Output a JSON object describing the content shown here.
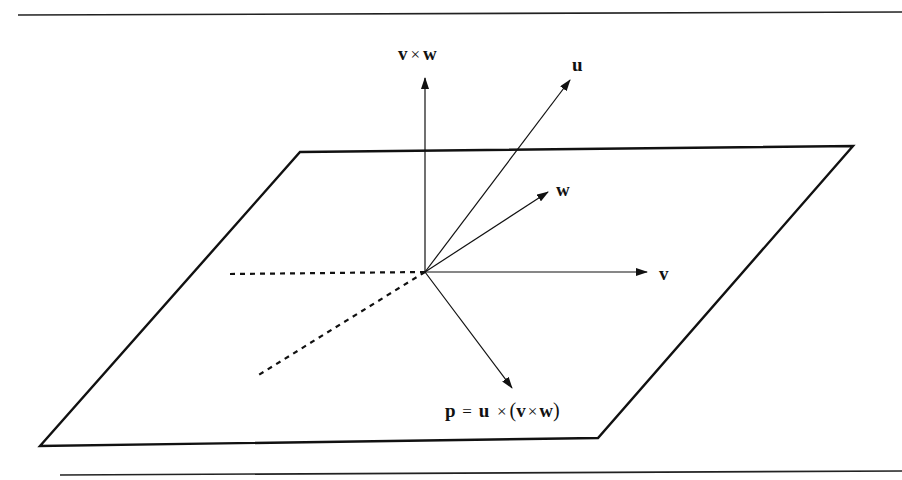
{
  "figure": {
    "colors": {
      "stroke": "#111111",
      "background": "#ffffff"
    },
    "rules": {
      "top": {
        "x1": 18,
        "y1": 15,
        "x2": 902,
        "y2": 12
      },
      "bottom": {
        "x1": 60,
        "y1": 475,
        "x2": 902,
        "y2": 471
      }
    },
    "plane": {
      "points": "300,152 853,146 598,438 40,446"
    },
    "origin": {
      "x": 425,
      "y": 272
    },
    "vectors": [
      {
        "id": "vxw",
        "x2": 425,
        "y2": 78
      },
      {
        "id": "u",
        "x2": 570,
        "y2": 80
      },
      {
        "id": "w",
        "x2": 548,
        "y2": 192
      },
      {
        "id": "v",
        "x2": 647,
        "y2": 272
      },
      {
        "id": "p",
        "x2": 512,
        "y2": 388
      }
    ],
    "dashed": [
      {
        "x2": 230,
        "y2": 274
      },
      {
        "x2": 257,
        "y2": 376
      }
    ],
    "labels": {
      "vxw": {
        "a": "v",
        "op": "×",
        "b": "w"
      },
      "u": "u",
      "w": "w",
      "v": "v",
      "p": {
        "lhs": "p",
        "eq": "=",
        "u": "u",
        "op1": "×",
        "open": "(",
        "v": "v",
        "op2": "×",
        "w": "w",
        "close": ")"
      }
    }
  }
}
